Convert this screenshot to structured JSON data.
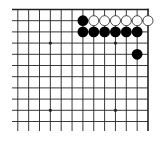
{
  "diagram": {
    "type": "go-board-fragment",
    "board_size": 19,
    "visible_region": "top-right corner",
    "visible_columns": [
      7,
      19
    ],
    "visible_rows": [
      1,
      11
    ],
    "colors": {
      "background": "#ffffff",
      "line": "#222222",
      "black_stone": "#000000",
      "white_stone": "#ffffff",
      "white_stone_outline": "#222222"
    },
    "star_points": [
      {
        "col": 10,
        "row": 4
      },
      {
        "col": 16,
        "row": 4
      },
      {
        "col": 10,
        "row": 10
      },
      {
        "col": 16,
        "row": 10
      }
    ],
    "stones": [
      {
        "color": "black",
        "col": 13,
        "row": 2
      },
      {
        "color": "white",
        "col": 14,
        "row": 2
      },
      {
        "color": "white",
        "col": 15,
        "row": 2
      },
      {
        "color": "white",
        "col": 16,
        "row": 2
      },
      {
        "color": "white",
        "col": 17,
        "row": 2
      },
      {
        "color": "white",
        "col": 18,
        "row": 2
      },
      {
        "color": "white",
        "col": 19,
        "row": 2
      },
      {
        "color": "black",
        "col": 13,
        "row": 3
      },
      {
        "color": "black",
        "col": 14,
        "row": 3
      },
      {
        "color": "black",
        "col": 15,
        "row": 3
      },
      {
        "color": "black",
        "col": 16,
        "row": 3
      },
      {
        "color": "black",
        "col": 17,
        "row": 3
      },
      {
        "color": "black",
        "col": 18,
        "row": 3
      },
      {
        "color": "black",
        "col": 18,
        "row": 5
      }
    ]
  }
}
